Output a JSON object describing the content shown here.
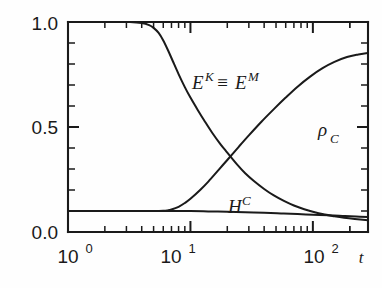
{
  "figure": {
    "name": "decay-curves-log-plot",
    "background": "#fefefe",
    "ink": "#1a1a1a"
  },
  "axes": {
    "x": {
      "name": "time-axis",
      "label": "t",
      "scale": "log",
      "tick_labels": [
        "10",
        "10",
        "10"
      ],
      "tick_exponents": [
        "0",
        "1",
        "2"
      ],
      "tick_values": [
        1,
        10,
        100
      ],
      "range": [
        1,
        282
      ]
    },
    "y": {
      "name": "value-axis",
      "scale": "linear",
      "tick_labels": [
        "0.0",
        "0.5",
        "1.0"
      ],
      "tick_values": [
        0.0,
        0.5,
        1.0
      ],
      "range": [
        0,
        1
      ],
      "minor_step": 0.1
    }
  },
  "curve_labels": {
    "energy": {
      "base1": "E",
      "sup1": "K",
      "equiv": "≡",
      "base2": "E",
      "sup2": "M"
    },
    "density": {
      "base": "ρ",
      "sub": "C"
    },
    "helicity": {
      "base": "H",
      "sup": "C"
    }
  },
  "chart_data": {
    "type": "line",
    "title": "",
    "xlabel": "t",
    "ylabel": "",
    "xscale": "log",
    "yscale": "linear",
    "xlim": [
      1,
      282
    ],
    "ylim": [
      0,
      1
    ],
    "xticks": [
      1,
      10,
      100
    ],
    "xticklabels": [
      "10^0",
      "10^1",
      "10^2"
    ],
    "yticks": [
      0.0,
      0.5,
      1.0
    ],
    "yticklabels": [
      "0.0",
      "0.5",
      "1.0"
    ],
    "grid": false,
    "legend": "inline-annotations",
    "series": [
      {
        "name": "E^K = E^M",
        "label": "E^K ≡ E^M",
        "annotation_position": {
          "x": 13,
          "y": 0.78
        },
        "x": [
          1.0,
          1.6,
          2.5,
          3.2,
          4.0,
          4.6,
          5.0,
          5.5,
          6.0,
          6.6,
          7.2,
          8.0,
          9.0,
          10.0,
          11.5,
          13.0,
          15.0,
          17.5,
          20.0,
          24.0,
          28.0,
          33.0,
          40.0,
          48.0,
          58.0,
          70.0,
          85.0,
          100.0,
          125.0,
          150.0,
          180.0,
          220.0,
          282.0
        ],
        "y": [
          1.0,
          1.0,
          1.0,
          1.0,
          0.995,
          0.985,
          0.972,
          0.948,
          0.912,
          0.862,
          0.812,
          0.752,
          0.69,
          0.64,
          0.58,
          0.53,
          0.474,
          0.42,
          0.378,
          0.322,
          0.28,
          0.243,
          0.205,
          0.174,
          0.148,
          0.126,
          0.108,
          0.096,
          0.083,
          0.075,
          0.068,
          0.062,
          0.056
        ]
      },
      {
        "name": "rho_C",
        "label": "ρ_C",
        "annotation_position": {
          "x": 170,
          "y": 0.52
        },
        "x": [
          1.0,
          2.0,
          3.0,
          4.0,
          5.0,
          6.0,
          6.5,
          7.0,
          8.0,
          9.0,
          10.0,
          12.0,
          14.0,
          17.0,
          20.0,
          25.0,
          30.0,
          38.0,
          48.0,
          60.0,
          75.0,
          95.0,
          120.0,
          150.0,
          190.0,
          235.0,
          282.0
        ],
        "y": [
          0.1,
          0.1,
          0.1,
          0.1,
          0.1,
          0.101,
          0.103,
          0.107,
          0.12,
          0.138,
          0.158,
          0.2,
          0.24,
          0.296,
          0.343,
          0.408,
          0.46,
          0.525,
          0.585,
          0.64,
          0.692,
          0.74,
          0.78,
          0.81,
          0.833,
          0.845,
          0.852
        ]
      },
      {
        "name": "H^C",
        "label": "H^C",
        "annotation_position": {
          "x": 30,
          "y": 0.175
        },
        "x": [
          1.0,
          2.0,
          4.0,
          6.0,
          8.0,
          10.0,
          14.0,
          20.0,
          28.0,
          40.0,
          55.0,
          75.0,
          100.0,
          135.0,
          175.0,
          225.0,
          282.0
        ],
        "y": [
          0.1,
          0.1,
          0.1,
          0.1,
          0.1,
          0.0995,
          0.098,
          0.0965,
          0.094,
          0.0915,
          0.0885,
          0.0855,
          0.0825,
          0.0795,
          0.0765,
          0.0735,
          0.071
        ]
      }
    ]
  }
}
